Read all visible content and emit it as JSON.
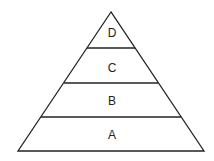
{
  "diagram": {
    "type": "pyramid",
    "levels": [
      {
        "label": "D",
        "position": "top"
      },
      {
        "label": "C",
        "position": "upper-middle"
      },
      {
        "label": "B",
        "position": "lower-middle"
      },
      {
        "label": "A",
        "position": "bottom"
      }
    ],
    "colors": {
      "stroke": "#222222",
      "fill": "#ffffff"
    }
  }
}
